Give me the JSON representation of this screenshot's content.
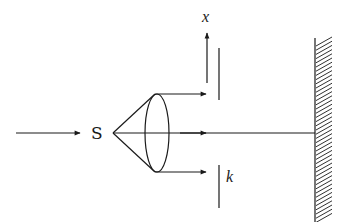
{
  "diagram": {
    "labels": {
      "source": "S",
      "x_axis": "x",
      "slit": "k"
    },
    "colors": {
      "ink": "#1a1a1a",
      "background": "#ffffff"
    },
    "elements": {
      "incident_arrow": {
        "x1": 16,
        "y1": 133,
        "x2": 80,
        "y2": 133
      },
      "source_point": {
        "x": 113,
        "y": 133
      },
      "lens": {
        "cx": 157,
        "cy": 133,
        "rx": 12,
        "ry": 39
      },
      "rays": [
        {
          "name": "upper-ray",
          "x1": 155,
          "y1": 94,
          "x2": 205,
          "y2": 94
        },
        {
          "name": "axis-ray",
          "x1": 113,
          "y1": 133,
          "x2": 315,
          "y2": 133
        },
        {
          "name": "lower-ray",
          "x1": 155,
          "y1": 172,
          "x2": 205,
          "y2": 172
        }
      ],
      "x_axis_arrow": {
        "x": 207,
        "y1": 83,
        "y2": 32
      },
      "slit_upper": {
        "x": 219,
        "y1": 48,
        "y2": 100
      },
      "slit_lower": {
        "x": 219,
        "y1": 165,
        "y2": 208
      },
      "mirror": {
        "x": 315,
        "y1": 38,
        "y2": 222,
        "hatch_width": 17
      }
    }
  }
}
